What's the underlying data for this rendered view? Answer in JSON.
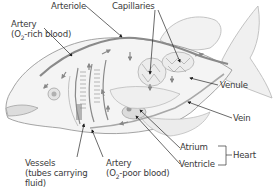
{
  "diagram": {
    "labels": {
      "arteriole": "Arteriole",
      "capillaries": "Capillaries",
      "artery_rich_line1": "Artery",
      "artery_rich_line2_pre": "(O",
      "artery_rich_line2_sub": "2",
      "artery_rich_line2_post": "-rich blood)",
      "venule": "Venule",
      "vein": "Vein",
      "atrium": "Atrium",
      "ventricle": "Ventricle",
      "heart": "Heart",
      "vessels_line1": "Vessels",
      "vessels_line2": "(tubes carrying",
      "vessels_line3": "fluid)",
      "artery_poor_line1": "Artery",
      "artery_poor_line2_pre": "(O",
      "artery_poor_line2_sub": "2",
      "artery_poor_line2_post": "-poor blood)"
    },
    "colors": {
      "outline": "#9a9a9a",
      "vessel": "#8c8c8c",
      "leader": "#2a2a2a",
      "text": "#3a3a3a"
    }
  }
}
